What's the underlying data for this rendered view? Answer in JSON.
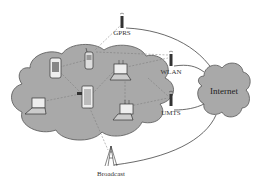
{
  "diagram": {
    "type": "network-topology",
    "colors": {
      "cloud_fill": "#a9a9a9",
      "cloud_stroke": "#555555",
      "line": "#444444",
      "link_dashed": "#777777",
      "background": "#ffffff"
    },
    "nodes": [
      {
        "id": "gprs",
        "label": "GPRS",
        "kind": "antenna"
      },
      {
        "id": "wlan",
        "label": "WLAN",
        "kind": "antenna"
      },
      {
        "id": "umts",
        "label": "UMTS",
        "kind": "antenna"
      },
      {
        "id": "broadcast",
        "label": "Broadcast",
        "kind": "broadcast-tower"
      },
      {
        "id": "internet",
        "label": "Internet",
        "kind": "cloud"
      },
      {
        "id": "adhoc",
        "label": "",
        "kind": "cloud",
        "devices": [
          "pda",
          "phone",
          "laptop-wifi-top",
          "laptop-left",
          "tablet",
          "laptop-wifi-bottom"
        ]
      }
    ],
    "edges": [
      {
        "from": "gprs",
        "to": "internet"
      },
      {
        "from": "wlan",
        "to": "internet"
      },
      {
        "from": "umts",
        "to": "internet"
      },
      {
        "from": "broadcast",
        "to": "internet"
      }
    ]
  }
}
